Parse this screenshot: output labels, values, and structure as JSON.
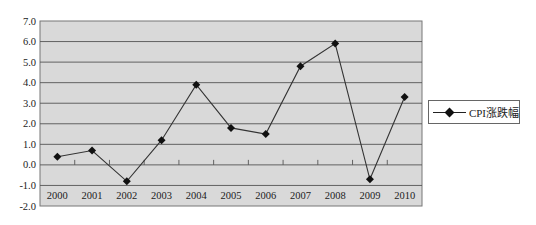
{
  "chart_data": {
    "type": "line",
    "title": "",
    "xlabel": "",
    "ylabel": "",
    "categories": [
      "2000",
      "2001",
      "2002",
      "2003",
      "2004",
      "2005",
      "2006",
      "2007",
      "2008",
      "2009",
      "2010"
    ],
    "series": [
      {
        "name": "CPI涨跌幅",
        "values": [
          0.4,
          0.7,
          -0.8,
          1.2,
          3.9,
          1.8,
          1.5,
          4.8,
          5.9,
          -0.7,
          3.3
        ],
        "color": "#111111",
        "marker": "diamond"
      }
    ],
    "ylim": [
      -2.0,
      7.0
    ],
    "yticks": [
      "7.0",
      "6.0",
      "5.0",
      "4.0",
      "3.0",
      "2.0",
      "1.0",
      "0.0",
      "-1.0",
      "-2.0"
    ],
    "grid": true,
    "legend_position": "right",
    "plot_background": "#d9d9d9"
  },
  "legend": {
    "label": "CPI涨跌幅"
  }
}
